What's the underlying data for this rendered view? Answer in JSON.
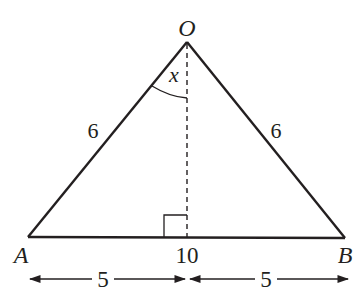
{
  "diagram": {
    "type": "isosceles-triangle",
    "vertices": {
      "apex": {
        "label": "O",
        "x": 187,
        "y": 42
      },
      "left": {
        "label": "A",
        "x": 28,
        "y": 237
      },
      "right": {
        "label": "B",
        "x": 345,
        "y": 238
      }
    },
    "labels": {
      "apex": "O",
      "left": "A",
      "right": "B",
      "side_left": "6",
      "side_right": "6",
      "base": "10",
      "angle": "x",
      "half_left": "5",
      "half_right": "5"
    },
    "colors": {
      "stroke": "#231f20",
      "background": "#ffffff"
    }
  }
}
